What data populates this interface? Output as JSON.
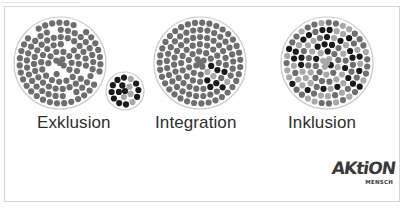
{
  "labels": {
    "exclusion": "Exklusion",
    "integration": "Integration",
    "inclusion": "Inklusion"
  },
  "logo": {
    "main": "AKtiON",
    "sub": "MENSCH"
  },
  "colors": {
    "majority": "#6e6e6e",
    "minority_light": "#a8a8a8",
    "minority_dark": "#1a1a1a",
    "ring": "#c8c8c8",
    "text": "#2e2e2e"
  },
  "circles": [
    {
      "id": "exclusion-main",
      "cx": 60,
      "cy": 63,
      "r": 46
    },
    {
      "id": "exclusion-small",
      "cx": 125,
      "cy": 91,
      "r": 19
    },
    {
      "id": "integration",
      "cx": 200,
      "cy": 63,
      "r": 46
    },
    {
      "id": "inclusion",
      "cx": 327,
      "cy": 63,
      "r": 46
    }
  ]
}
